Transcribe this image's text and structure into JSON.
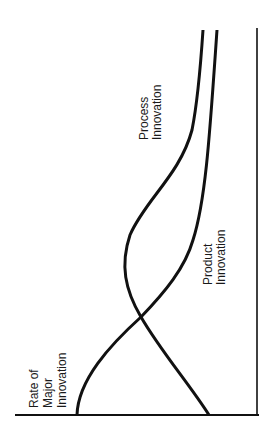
{
  "diagram": {
    "orientation": "rotated-90-ccw",
    "axis_label_lines": [
      "Rate of",
      "Major",
      "Innovation"
    ],
    "curves": [
      {
        "name": "Process Innovation",
        "label_lines": [
          "Process",
          "Innovation"
        ]
      },
      {
        "name": "Product Innovation",
        "label_lines": [
          "Product",
          "Innovation"
        ]
      }
    ],
    "line_color": "#111111",
    "background": "#ffffff"
  }
}
